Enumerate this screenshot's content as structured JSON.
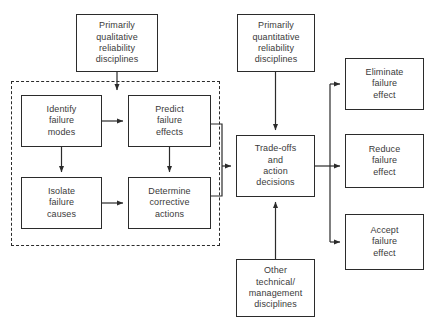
{
  "diagram": {
    "canvas": {
      "width": 441,
      "height": 325
    },
    "stroke_color": "#2b2b2b",
    "text_color": "#3a3a3a",
    "background_color": "#ffffff",
    "nodes": [
      {
        "id": "primarily-qualitative",
        "label": "Primarily\nqualitative\nreliability\ndisciplines",
        "x": 76,
        "y": 14,
        "w": 82,
        "h": 58
      },
      {
        "id": "primarily-quantitative",
        "label": "Primarily\nquantitative\nreliability\ndisciplines",
        "x": 237,
        "y": 14,
        "w": 78,
        "h": 58
      },
      {
        "id": "identify-failure-modes",
        "label": "Identify\nfailure\nmodes",
        "x": 21,
        "y": 95,
        "w": 81,
        "h": 52
      },
      {
        "id": "predict-failure-effects",
        "label": "Predict\nfailure\neffects",
        "x": 128,
        "y": 95,
        "w": 83,
        "h": 52
      },
      {
        "id": "isolate-failure-causes",
        "label": "Isolate\nfailure\ncauses",
        "x": 21,
        "y": 177,
        "w": 81,
        "h": 52
      },
      {
        "id": "determine-corrective-actions",
        "label": "Determine\ncorrective\nactions",
        "x": 128,
        "y": 177,
        "w": 83,
        "h": 52
      },
      {
        "id": "trade-offs-and-action-decisions",
        "label": "Trade-offs\nand\naction\ndecisions",
        "x": 236,
        "y": 135,
        "w": 79,
        "h": 62
      },
      {
        "id": "other-technical-management",
        "label": "Other\ntechnical/\nmanagement\ndisciplines",
        "x": 236,
        "y": 259,
        "w": 79,
        "h": 58
      },
      {
        "id": "eliminate-failure-effect",
        "label": "Eliminate\nfailure\neffect",
        "x": 345,
        "y": 58,
        "w": 79,
        "h": 52
      },
      {
        "id": "reduce-failure-effect",
        "label": "Reduce\nfailure\neffect",
        "x": 345,
        "y": 134,
        "w": 79,
        "h": 54
      },
      {
        "id": "accept-failure-effect",
        "label": "Accept\nfailure\neffect",
        "x": 345,
        "y": 214,
        "w": 79,
        "h": 56
      }
    ],
    "groups": [
      {
        "id": "qualitative-group",
        "label": "qualitative disciplines dashed grouping",
        "x": 11,
        "y": 81,
        "w": 209,
        "h": 165
      }
    ],
    "connectors": [
      {
        "id": "qualitative-to-predict",
        "label": "Primarily qualitative disciplines to Predict failure effects"
      },
      {
        "id": "identify-to-predict",
        "label": "Identify failure modes to Predict failure effects"
      },
      {
        "id": "identify-to-isolate",
        "label": "Identify failure modes to Isolate failure causes"
      },
      {
        "id": "predict-to-determine",
        "label": "Predict failure effects to Determine corrective actions"
      },
      {
        "id": "isolate-to-determine",
        "label": "Isolate failure causes to Determine corrective actions"
      },
      {
        "id": "predict-to-tradeoffs",
        "label": "Predict failure effects to Trade-offs and action decisions"
      },
      {
        "id": "determine-to-tradeoffs",
        "label": "Determine corrective actions to Trade-offs and action decisions"
      },
      {
        "id": "quantitative-to-tradeoffs",
        "label": "Primarily quantitative disciplines to Trade-offs and action decisions"
      },
      {
        "id": "other-to-tradeoffs",
        "label": "Other technical/management disciplines to Trade-offs and action decisions"
      },
      {
        "id": "tradeoffs-to-eliminate",
        "label": "Trade-offs to Eliminate failure effect"
      },
      {
        "id": "tradeoffs-to-reduce",
        "label": "Trade-offs to Reduce failure effect"
      },
      {
        "id": "tradeoffs-to-accept",
        "label": "Trade-offs to Accept failure effect"
      }
    ]
  }
}
